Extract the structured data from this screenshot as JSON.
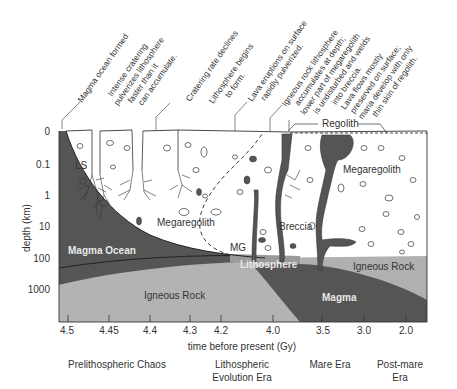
{
  "diagram": {
    "type": "lunar-crust-evolution-cross-section",
    "colors": {
      "magma_dark": "#555555",
      "igneous_rock": "#b3b3b3",
      "lithosphere_band": "#9a9a9a",
      "regolith_white": "#ffffff",
      "line": "#333333"
    },
    "annotations": [
      {
        "id": "magma-ocean-formed",
        "lines": [
          "Magma ocean formed"
        ]
      },
      {
        "id": "intense-cratering",
        "lines": [
          "Intense cratering",
          "pulverizes lithosphere",
          "faster than it",
          "can accumulate."
        ]
      },
      {
        "id": "cratering-declines",
        "lines": [
          "Cratering rate declines"
        ]
      },
      {
        "id": "lithosphere-begins",
        "lines": [
          "Lithosphere begins",
          "to form."
        ]
      },
      {
        "id": "lava-eruptions",
        "lines": [
          "Lava eruptions on surface",
          "rapidly pulverized."
        ]
      },
      {
        "id": "igneous-lithosphere",
        "lines": [
          "Igneous rock lithosphere",
          "accumulates at depth;",
          "lower part of megaregolith",
          "is undisturbed and welds",
          "into breccia."
        ]
      },
      {
        "id": "lava-preserved",
        "lines": [
          "Lava flows mostly",
          "preserved on surface;",
          "maria develop with only",
          "thin skin of regolith."
        ]
      }
    ],
    "regions": {
      "regolith": "Regolith",
      "ls": "LS",
      "megaregolith_left": "Megaregolith",
      "megaregolith_right": "Megaregolith",
      "magma_ocean": "Magma Ocean",
      "mg": "MG",
      "breccia": "Breccia",
      "lithosphere": "Lithosphere",
      "igneous_rock_right": "Igneous Rock",
      "igneous_rock_bottom": "Igneous Rock",
      "magma": "Magma"
    },
    "y_axis": {
      "label": "depth (km)",
      "ticks": [
        "0",
        "0.1",
        "1",
        "10",
        "100",
        "1000"
      ]
    },
    "x_axis": {
      "label": "time before present (Gy)",
      "ticks": [
        "4.5",
        "4.45",
        "4.4",
        "4.3",
        "4.2",
        "4.0",
        "3.5",
        "3.0",
        "2.0"
      ]
    },
    "eras": [
      {
        "lines": [
          "Prelithospheric Chaos"
        ]
      },
      {
        "lines": [
          "Lithospheric",
          "Evolution Era"
        ]
      },
      {
        "lines": [
          "Mare Era"
        ]
      },
      {
        "lines": [
          "Post-mare",
          "Era"
        ]
      }
    ]
  }
}
